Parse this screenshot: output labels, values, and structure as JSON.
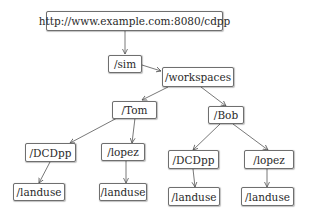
{
  "diagram": {
    "type": "url-hierarchy-tree",
    "nodes": {
      "root": "http://www.example.com:8080/cdpp",
      "sim": "/sim",
      "workspaces": "/workspaces",
      "tom": "/Tom",
      "bob": "/Bob",
      "tom_dcdpp": "/DCDpp",
      "tom_lopez": "/lopez",
      "tom_dcdpp_landuse": "/landuse",
      "tom_lopez_landuse": "/landuse",
      "bob_dcdpp": "/DCDpp",
      "bob_lopez": "/lopez",
      "bob_dcdpp_landuse": "/landuse",
      "bob_lopez_landuse": "/landuse"
    },
    "edges": [
      [
        "root",
        "sim"
      ],
      [
        "sim",
        "workspaces"
      ],
      [
        "workspaces",
        "tom"
      ],
      [
        "workspaces",
        "bob"
      ],
      [
        "tom",
        "tom_dcdpp"
      ],
      [
        "tom",
        "tom_lopez"
      ],
      [
        "tom_dcdpp",
        "tom_dcdpp_landuse"
      ],
      [
        "tom_lopez",
        "tom_lopez_landuse"
      ],
      [
        "bob",
        "bob_dcdpp"
      ],
      [
        "bob",
        "bob_lopez"
      ],
      [
        "bob_dcdpp",
        "bob_dcdpp_landuse"
      ],
      [
        "bob_lopez",
        "bob_lopez_landuse"
      ]
    ]
  }
}
